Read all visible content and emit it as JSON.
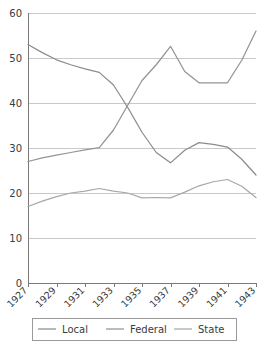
{
  "chart_data": {
    "type": "line",
    "title": "",
    "xlabel": "",
    "ylabel": "",
    "x": [
      1927,
      1928,
      1929,
      1930,
      1931,
      1932,
      1933,
      1934,
      1935,
      1936,
      1937,
      1938,
      1939,
      1940,
      1941,
      1942,
      1943
    ],
    "xlim": [
      1927,
      1943
    ],
    "ylim": [
      0,
      60
    ],
    "yticks": [
      0,
      10,
      20,
      30,
      40,
      50,
      60
    ],
    "xticks_labeled": [
      1927,
      1929,
      1931,
      1933,
      1935,
      1937,
      1939,
      1941,
      1943
    ],
    "grid": "horizontal",
    "legend_position": "bottom",
    "series": [
      {
        "name": "Local",
        "color": "#8c8c8c",
        "values": [
          53.0,
          51.2,
          49.6,
          48.5,
          47.6,
          46.8,
          44.0,
          39.0,
          33.5,
          29.0,
          26.7,
          29.5,
          31.2,
          30.8,
          30.2,
          27.5,
          24.0
        ]
      },
      {
        "name": "Federal",
        "color": "#949494",
        "values": [
          27.0,
          27.8,
          28.4,
          29.0,
          29.6,
          30.1,
          34.0,
          39.5,
          45.0,
          48.5,
          52.6,
          47.0,
          44.5,
          44.5,
          44.5,
          49.5,
          56.0
        ]
      },
      {
        "name": "State",
        "color": "#a8a8a8",
        "values": [
          17.0,
          18.2,
          19.2,
          20.0,
          20.4,
          21.0,
          20.4,
          20.0,
          18.9,
          19.0,
          18.9,
          20.2,
          21.6,
          22.5,
          23.0,
          21.5,
          19.0
        ]
      }
    ]
  },
  "legend": {
    "items": [
      {
        "label": "Local"
      },
      {
        "label": "Federal"
      },
      {
        "label": "State"
      }
    ]
  },
  "axes": {
    "y_labels": [
      "60",
      "50",
      "40",
      "30",
      "20",
      "10",
      "0"
    ],
    "x_labels": [
      "1927",
      "1929",
      "1931",
      "1933",
      "1935",
      "1937",
      "1939",
      "1941",
      "1943"
    ]
  },
  "colors": {
    "background": "#ffffff",
    "grid": "#c9c9c9",
    "axis": "#7a7a7a",
    "text": "#3b3b3b",
    "legend_border": "#9a9a9a"
  }
}
